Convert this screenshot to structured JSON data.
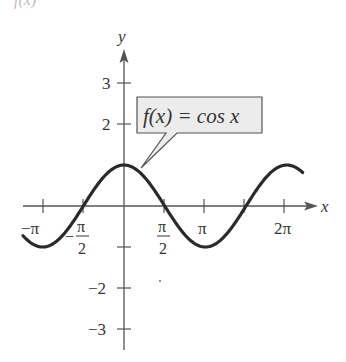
{
  "top_fragment": "f(x)",
  "chart_data": {
    "type": "line",
    "title": "",
    "function_label": "f(x) = cos x",
    "xlabel": "x",
    "ylabel": "y",
    "xlim": [
      -3.45,
      5.95
    ],
    "ylim": [
      -3.5,
      3.8
    ],
    "x_ticks": [
      {
        "value": -3.14159,
        "label": "−π"
      },
      {
        "value": -1.5708,
        "label": "−π/2"
      },
      {
        "value": 1.5708,
        "label": "π/2"
      },
      {
        "value": 3.14159,
        "label": "π"
      },
      {
        "value": 4.71239,
        "label": ""
      },
      {
        "value": 6.28318,
        "label": "2π"
      }
    ],
    "y_ticks": [
      {
        "value": 3,
        "label": "3"
      },
      {
        "value": 2,
        "label": "2"
      },
      {
        "value": 1,
        "label": ""
      },
      {
        "value": -1,
        "label": ""
      },
      {
        "value": -2,
        "label": "−2"
      },
      {
        "value": -3,
        "label": "−3"
      }
    ],
    "series": [
      {
        "name": "f(x) = cos x",
        "x_range": [
          -3.9,
          6.9
        ],
        "function": "cos"
      }
    ],
    "grid": false,
    "legend": "callout box"
  },
  "labels": {
    "x_axis": "x",
    "y_axis": "y",
    "callout": "f(x) = cos x",
    "tick_neg_pi": "−π",
    "tick_neg_half_pi_num": "π",
    "tick_neg_half_pi_den": "2",
    "tick_half_pi_num": "π",
    "tick_half_pi_den": "2",
    "tick_pi": "π",
    "tick_2pi": "2π",
    "tick_y3": "3",
    "tick_y2": "2",
    "tick_yneg2": "−2",
    "tick_yneg3": "−3"
  },
  "colors": {
    "curve": "#2a2a2a",
    "axis": "#555555",
    "callout_fill": "#ececec",
    "callout_border": "#555555"
  }
}
